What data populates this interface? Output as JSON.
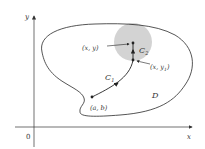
{
  "diagram": {
    "axes": {
      "x_label": "x",
      "y_label": "y",
      "origin_label": "0"
    },
    "region_label": "D",
    "curves": [
      {
        "label": "C",
        "subscript": "1"
      },
      {
        "label": "C",
        "subscript": "2"
      }
    ],
    "points": {
      "start": "(a, b)",
      "top": "(x, y)",
      "bottom": "(x, y",
      "bottom_subscript": "1",
      "bottom_close": ")"
    },
    "colors": {
      "disk": "#d3d3d3",
      "stroke": "#2a2a2a"
    }
  }
}
